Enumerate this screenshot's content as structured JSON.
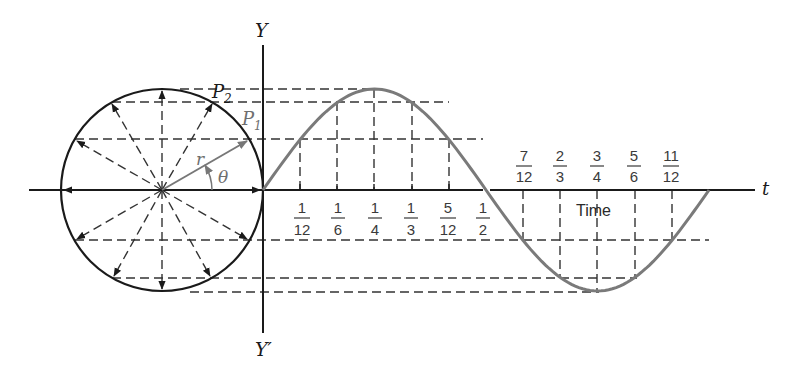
{
  "diagram": {
    "labels": {
      "y_axis_top": "Y",
      "y_axis_bottom": "Y′",
      "t_axis": "t",
      "p2": "P",
      "p2_sub": "2",
      "p1": "P",
      "p1_sub": "1",
      "radius": "r",
      "angle": "θ",
      "time": "Time"
    },
    "ticks_above_axis": [
      {
        "num": "7",
        "den": "12"
      },
      {
        "num": "2",
        "den": "3"
      },
      {
        "num": "3",
        "den": "4"
      },
      {
        "num": "5",
        "den": "6"
      },
      {
        "num": "11",
        "den": "12"
      }
    ],
    "ticks_below_axis": [
      {
        "num": "1",
        "den": "12"
      },
      {
        "num": "1",
        "den": "6"
      },
      {
        "num": "1",
        "den": "4"
      },
      {
        "num": "1",
        "den": "3"
      },
      {
        "num": "5",
        "den": "12"
      },
      {
        "num": "1",
        "den": "2"
      }
    ],
    "colors": {
      "ink": "#1a1a1a",
      "curve": "#7a7a7a",
      "vector_r": "#777777"
    }
  },
  "chart_data": {
    "type": "line",
    "title": "",
    "xlabel": "Time (t)",
    "ylabel": "Y",
    "x": [
      0,
      0.0833,
      0.1667,
      0.25,
      0.3333,
      0.4167,
      0.5,
      0.5833,
      0.6667,
      0.75,
      0.8333,
      0.9167,
      1.0
    ],
    "series": [
      {
        "name": "r sin(2πt)",
        "values": [
          0,
          0.5,
          0.866,
          1,
          0.866,
          0.5,
          0,
          -0.5,
          -0.866,
          -1,
          -0.866,
          -0.5,
          0
        ]
      }
    ],
    "xlim": [
      0,
      1
    ],
    "ylim": [
      -1,
      1
    ],
    "grid": false
  }
}
